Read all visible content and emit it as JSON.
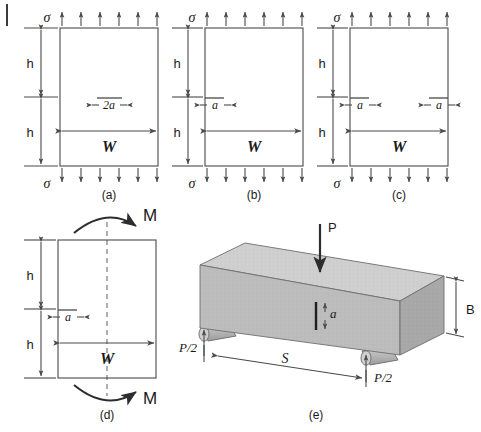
{
  "figure": {
    "panels": [
      {
        "id": "a",
        "caption": "(a)",
        "type": "center-cracked-tension-plate",
        "crack": "center-through-crack",
        "labels": {
          "stress_top": "σ",
          "stress_bottom": "σ",
          "height_upper": "h",
          "height_lower": "h",
          "width": "W",
          "crack_length": "2a"
        },
        "arrow_count_top": 6,
        "arrow_count_bottom": 6
      },
      {
        "id": "b",
        "caption": "(b)",
        "type": "single-edge-cracked-tension-plate",
        "crack": "single-edge-crack-left",
        "labels": {
          "stress_top": "σ",
          "stress_bottom": "σ",
          "height_upper": "h",
          "height_lower": "h",
          "width": "W",
          "crack_length": "a"
        },
        "arrow_count_top": 6,
        "arrow_count_bottom": 6
      },
      {
        "id": "c",
        "caption": "(c)",
        "type": "double-edge-cracked-tension-plate",
        "crack": "double-edge-crack",
        "labels": {
          "stress_top": "σ",
          "stress_bottom": "σ",
          "height_upper": "h",
          "height_lower": "h",
          "width": "W",
          "crack_length_left": "a",
          "crack_length_right": "a"
        },
        "arrow_count_top": 6,
        "arrow_count_bottom": 6
      },
      {
        "id": "d",
        "caption": "(d)",
        "type": "single-edge-cracked-bending-plate",
        "crack": "single-edge-crack-left",
        "labels": {
          "moment_top": "M",
          "moment_bottom": "M",
          "height_upper": "h",
          "height_lower": "h",
          "width": "W",
          "crack_length": "a"
        }
      },
      {
        "id": "e",
        "caption": "(e)",
        "type": "three-point-bend-specimen",
        "crack": "edge-notch-bottom",
        "labels": {
          "load": "P",
          "reaction_left": "P/2",
          "reaction_right": "P/2",
          "span": "S",
          "thickness": "B",
          "crack_length": "a"
        },
        "colors": {
          "beam_top_face": "#c8c8c8",
          "beam_front_face": "#b4b4b4",
          "beam_end_face": "#a0a0a0",
          "roller": "#bdbdbd",
          "outline": "#555555"
        }
      }
    ],
    "style": {
      "line_color": "#4a4a4a",
      "text_color": "#1a1a1a",
      "background": "#ffffff"
    }
  }
}
